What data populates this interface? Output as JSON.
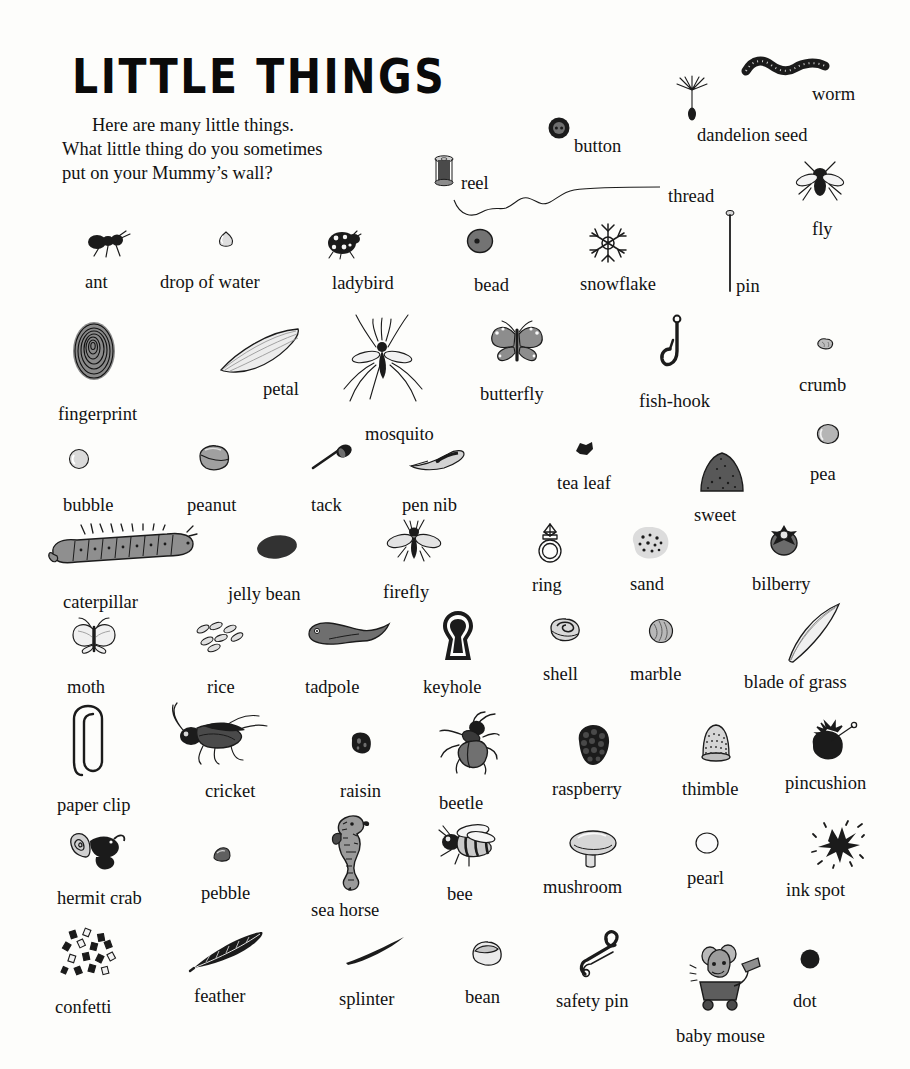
{
  "page": {
    "title": "LITTLE THINGS",
    "background_color": "#fdfdfb",
    "ink_color": "#1b1b1b"
  },
  "intro": {
    "line1": "Here are many little things.",
    "line2": "What little thing do you sometimes",
    "line3": "put on your Mummy’s wall?"
  },
  "items": [
    {
      "label": "worm",
      "icon": "worm-icon",
      "x": 812,
      "y": 84,
      "art_x": 743,
      "art_y": 55
    },
    {
      "label": "dandelion seed",
      "icon": "dandelion-seed-icon",
      "x": 697,
      "y": 125,
      "art_x": 675,
      "art_y": 76
    },
    {
      "label": "button",
      "icon": "button-icon",
      "x": 574,
      "y": 136,
      "art_x": 548,
      "art_y": 117
    },
    {
      "label": "reel",
      "icon": "reel-icon",
      "x": 461,
      "y": 173,
      "art_x": 432,
      "art_y": 155
    },
    {
      "label": "thread",
      "icon": "thread-icon",
      "x": 668,
      "y": 186,
      "art_x": 452,
      "art_y": 178
    },
    {
      "label": "fly",
      "icon": "fly-icon",
      "x": 812,
      "y": 219,
      "art_x": 793,
      "art_y": 160
    },
    {
      "label": "ant",
      "icon": "ant-icon",
      "x": 85,
      "y": 272,
      "art_x": 86,
      "art_y": 230
    },
    {
      "label": "drop of water",
      "icon": "drop-of-water-icon",
      "x": 160,
      "y": 272,
      "art_x": 216,
      "art_y": 230
    },
    {
      "label": "ladybird",
      "icon": "ladybird-icon",
      "x": 332,
      "y": 273,
      "art_x": 325,
      "art_y": 230
    },
    {
      "label": "bead",
      "icon": "bead-icon",
      "x": 474,
      "y": 275,
      "art_x": 466,
      "art_y": 228
    },
    {
      "label": "snowflake",
      "icon": "snowflake-icon",
      "x": 580,
      "y": 274,
      "art_x": 586,
      "art_y": 222
    },
    {
      "label": "pin",
      "icon": "pin-icon",
      "x": 736,
      "y": 276,
      "art_x": 723,
      "art_y": 209
    },
    {
      "label": "fingerprint",
      "icon": "fingerprint-icon",
      "x": 58,
      "y": 404,
      "art_x": 70,
      "art_y": 320
    },
    {
      "label": "petal",
      "icon": "petal-icon",
      "x": 263,
      "y": 379,
      "art_x": 218,
      "art_y": 327
    },
    {
      "label": "mosquito",
      "icon": "mosquito-icon",
      "x": 365,
      "y": 424,
      "art_x": 340,
      "art_y": 313
    },
    {
      "label": "butterfly",
      "icon": "butterfly-icon",
      "x": 480,
      "y": 384,
      "art_x": 488,
      "art_y": 320
    },
    {
      "label": "fish-hook",
      "icon": "fish-hook-icon",
      "x": 639,
      "y": 391,
      "art_x": 658,
      "art_y": 315
    },
    {
      "label": "crumb",
      "icon": "crumb-icon",
      "x": 799,
      "y": 375,
      "art_x": 815,
      "art_y": 337
    },
    {
      "label": "bubble",
      "icon": "bubble-icon",
      "x": 63,
      "y": 495,
      "art_x": 68,
      "art_y": 448
    },
    {
      "label": "peanut",
      "icon": "peanut-icon",
      "x": 187,
      "y": 495,
      "art_x": 196,
      "art_y": 444
    },
    {
      "label": "tack",
      "icon": "tack-icon",
      "x": 311,
      "y": 495,
      "art_x": 311,
      "art_y": 444
    },
    {
      "label": "pen nib",
      "icon": "pen-nib-icon",
      "x": 402,
      "y": 495,
      "art_x": 408,
      "art_y": 448
    },
    {
      "label": "tea leaf",
      "icon": "tea-leaf-icon",
      "x": 557,
      "y": 473,
      "art_x": 573,
      "art_y": 440
    },
    {
      "label": "sweet",
      "icon": "sweet-icon",
      "x": 694,
      "y": 505,
      "art_x": 696,
      "art_y": 450
    },
    {
      "label": "pea",
      "icon": "pea-icon",
      "x": 810,
      "y": 464,
      "art_x": 816,
      "art_y": 423
    },
    {
      "label": "caterpillar",
      "icon": "caterpillar-icon",
      "x": 63,
      "y": 592,
      "art_x": 47,
      "art_y": 524
    },
    {
      "label": "jelly bean",
      "icon": "jelly-bean-icon",
      "x": 228,
      "y": 584,
      "art_x": 255,
      "art_y": 533
    },
    {
      "label": "firefly",
      "icon": "firefly-icon",
      "x": 383,
      "y": 582,
      "art_x": 386,
      "art_y": 519
    },
    {
      "label": "ring",
      "icon": "ring-icon",
      "x": 532,
      "y": 575,
      "art_x": 534,
      "art_y": 522
    },
    {
      "label": "sand",
      "icon": "sand-icon",
      "x": 630,
      "y": 574,
      "art_x": 628,
      "art_y": 524
    },
    {
      "label": "bilberry",
      "icon": "bilberry-icon",
      "x": 752,
      "y": 574,
      "art_x": 766,
      "art_y": 521
    },
    {
      "label": "moth",
      "icon": "moth-icon",
      "x": 67,
      "y": 677,
      "art_x": 70,
      "art_y": 617
    },
    {
      "label": "rice",
      "icon": "rice-icon",
      "x": 207,
      "y": 677,
      "art_x": 194,
      "art_y": 621
    },
    {
      "label": "tadpole",
      "icon": "tadpole-icon",
      "x": 305,
      "y": 677,
      "art_x": 305,
      "art_y": 621
    },
    {
      "label": "keyhole",
      "icon": "keyhole-icon",
      "x": 423,
      "y": 677,
      "art_x": 439,
      "art_y": 610
    },
    {
      "label": "shell",
      "icon": "shell-icon",
      "x": 543,
      "y": 664,
      "art_x": 548,
      "art_y": 617
    },
    {
      "label": "marble",
      "icon": "marble-icon",
      "x": 630,
      "y": 664,
      "art_x": 648,
      "art_y": 618
    },
    {
      "label": "blade of grass",
      "icon": "blade-of-grass-icon",
      "x": 744,
      "y": 672,
      "art_x": 785,
      "art_y": 602
    },
    {
      "label": "paper clip",
      "icon": "paper-clip-icon",
      "x": 57,
      "y": 795,
      "art_x": 72,
      "art_y": 703
    },
    {
      "label": "cricket",
      "icon": "cricket-icon",
      "x": 205,
      "y": 781,
      "art_x": 163,
      "art_y": 702
    },
    {
      "label": "raisin",
      "icon": "raisin-icon",
      "x": 340,
      "y": 781,
      "art_x": 348,
      "art_y": 730
    },
    {
      "label": "beetle",
      "icon": "beetle-icon",
      "x": 439,
      "y": 793,
      "art_x": 437,
      "art_y": 711
    },
    {
      "label": "raspberry",
      "icon": "raspberry-icon",
      "x": 552,
      "y": 779,
      "art_x": 573,
      "art_y": 723
    },
    {
      "label": "thimble",
      "icon": "thimble-icon",
      "x": 682,
      "y": 779,
      "art_x": 697,
      "art_y": 722
    },
    {
      "label": "pincushion",
      "icon": "pincushion-icon",
      "x": 785,
      "y": 773,
      "art_x": 805,
      "art_y": 721
    },
    {
      "label": "hermit crab",
      "icon": "hermit-crab-icon",
      "x": 57,
      "y": 888,
      "art_x": 70,
      "art_y": 827
    },
    {
      "label": "pebble",
      "icon": "pebble-icon",
      "x": 201,
      "y": 883,
      "art_x": 212,
      "art_y": 846
    },
    {
      "label": "sea horse",
      "icon": "sea-horse-icon",
      "x": 311,
      "y": 900,
      "art_x": 327,
      "art_y": 812
    },
    {
      "label": "bee",
      "icon": "bee-icon",
      "x": 447,
      "y": 884,
      "art_x": 435,
      "art_y": 824
    },
    {
      "label": "mushroom",
      "icon": "mushroom-icon",
      "x": 543,
      "y": 877,
      "art_x": 568,
      "art_y": 827
    },
    {
      "label": "pearl",
      "icon": "pearl-icon",
      "x": 687,
      "y": 868,
      "art_x": 694,
      "art_y": 831
    },
    {
      "label": "ink spot",
      "icon": "ink-spot-icon",
      "x": 786,
      "y": 880,
      "art_x": 812,
      "art_y": 823
    },
    {
      "label": "confetti",
      "icon": "confetti-icon",
      "x": 55,
      "y": 997,
      "art_x": 60,
      "art_y": 927
    },
    {
      "label": "feather",
      "icon": "feather-icon",
      "x": 194,
      "y": 986,
      "art_x": 190,
      "art_y": 930
    },
    {
      "label": "splinter",
      "icon": "splinter-icon",
      "x": 339,
      "y": 989,
      "art_x": 344,
      "art_y": 935
    },
    {
      "label": "bean",
      "icon": "bean-icon",
      "x": 465,
      "y": 987,
      "art_x": 470,
      "art_y": 940
    },
    {
      "label": "safety pin",
      "icon": "safety-pin-icon",
      "x": 556,
      "y": 991,
      "art_x": 577,
      "art_y": 928
    },
    {
      "label": "baby mouse",
      "icon": "baby-mouse-icon",
      "x": 676,
      "y": 1026,
      "art_x": 690,
      "art_y": 938
    },
    {
      "label": "dot",
      "icon": "dot-icon",
      "x": 793,
      "y": 991,
      "art_x": 799,
      "art_y": 948
    }
  ]
}
